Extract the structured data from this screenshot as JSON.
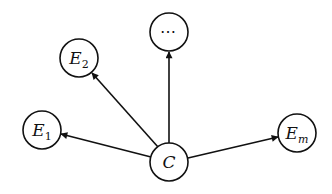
{
  "diagram": {
    "type": "directed-graph",
    "center_node": {
      "id": "C",
      "label": "C"
    },
    "nodes": [
      {
        "id": "E1",
        "label": "E",
        "subscript": "1"
      },
      {
        "id": "E2",
        "label": "E",
        "subscript": "2"
      },
      {
        "id": "dots",
        "label": "⋯"
      },
      {
        "id": "Em",
        "label": "E",
        "subscript": "m"
      }
    ],
    "edges": [
      {
        "from": "C",
        "to": "E1"
      },
      {
        "from": "C",
        "to": "E2"
      },
      {
        "from": "C",
        "to": "dots"
      },
      {
        "from": "C",
        "to": "Em"
      }
    ],
    "colors": {
      "stroke": "#111111",
      "background": "#ffffff"
    }
  }
}
